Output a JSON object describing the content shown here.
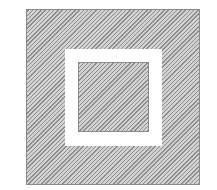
{
  "diagram": {
    "shapes": [
      {
        "id": "outer-square",
        "fill": "diagonal-hatch",
        "color": "#8c8c8c"
      },
      {
        "id": "white-frame",
        "fill": "solid",
        "color": "#ffffff"
      },
      {
        "id": "inner-square",
        "fill": "diagonal-hatch",
        "color": "#8c8c8c"
      }
    ]
  }
}
